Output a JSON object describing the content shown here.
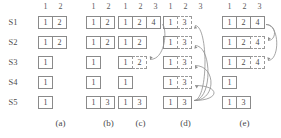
{
  "figure": {
    "row_labels": [
      "S1",
      "S2",
      "S3",
      "S4",
      "S5"
    ],
    "captions": [
      "(a)",
      "(b)",
      "(c)",
      "(d)",
      "(e)"
    ],
    "panels": [
      {
        "id": "a",
        "caption": "(a)",
        "headers": [
          "1",
          "2"
        ],
        "rows": [
          {
            "label": "S1",
            "cells": [
              {
                "value": "1",
                "style": "solid"
              },
              {
                "value": "2",
                "style": "solid"
              }
            ]
          },
          {
            "label": "S2",
            "cells": [
              {
                "value": "1",
                "style": "solid"
              },
              {
                "value": "2",
                "style": "solid"
              }
            ]
          },
          {
            "label": "S3",
            "cells": [
              {
                "value": "1",
                "style": "solid"
              }
            ]
          },
          {
            "label": "S4",
            "cells": [
              {
                "value": "1",
                "style": "solid"
              }
            ]
          },
          {
            "label": "S5",
            "cells": [
              {
                "value": "1",
                "style": "solid"
              }
            ]
          }
        ],
        "arrows": []
      },
      {
        "id": "b",
        "caption": "(b)",
        "headers": [
          "1",
          "2"
        ],
        "rows": [
          {
            "label": "S1",
            "cells": [
              {
                "value": "1",
                "style": "solid"
              },
              {
                "value": "2",
                "style": "solid"
              }
            ]
          },
          {
            "label": "S2",
            "cells": [
              {
                "value": "1",
                "style": "solid"
              },
              {
                "value": "2",
                "style": "solid"
              }
            ]
          },
          {
            "label": "S3",
            "cells": [
              {
                "value": "1",
                "style": "solid"
              }
            ]
          },
          {
            "label": "S4",
            "cells": [
              {
                "value": "1",
                "style": "solid"
              }
            ]
          },
          {
            "label": "S5",
            "cells": [
              {
                "value": "1",
                "style": "solid"
              },
              {
                "value": "3",
                "style": "solid"
              }
            ]
          }
        ],
        "arrows": []
      },
      {
        "id": "c",
        "caption": "(c)",
        "headers": [
          "1",
          "2",
          "3"
        ],
        "rows": [
          {
            "label": "S1",
            "cells": [
              {
                "value": "1",
                "style": "solid"
              },
              {
                "value": "2",
                "style": "solid"
              },
              {
                "value": "4",
                "style": "solid"
              }
            ]
          },
          {
            "label": "S2",
            "cells": [
              {
                "value": "1",
                "style": "solid"
              },
              {
                "value": "2",
                "style": "solid"
              }
            ]
          },
          {
            "label": "S3",
            "cells": [
              {
                "value": "1",
                "style": "solid"
              },
              {
                "value": "2",
                "style": "dashed"
              }
            ]
          },
          {
            "label": "S4",
            "cells": [
              {
                "value": "1",
                "style": "solid"
              }
            ]
          },
          {
            "label": "S5",
            "cells": [
              {
                "value": "1",
                "style": "solid"
              },
              {
                "value": "3",
                "style": "solid"
              }
            ]
          }
        ],
        "arrows": [
          {
            "from_row": "S1",
            "to_row": "S3"
          }
        ]
      },
      {
        "id": "d",
        "caption": "(d)",
        "headers": [
          "1",
          "2",
          "3"
        ],
        "rows": [
          {
            "label": "S1",
            "cells": [
              {
                "value": "1",
                "style": "solid"
              },
              {
                "value": "3",
                "style": "dashed"
              }
            ]
          },
          {
            "label": "S2",
            "cells": [
              {
                "value": "1",
                "style": "solid"
              },
              {
                "value": "3",
                "style": "dashed"
              }
            ]
          },
          {
            "label": "S3",
            "cells": [
              {
                "value": "1",
                "style": "solid"
              },
              {
                "value": "3",
                "style": "dashed"
              }
            ]
          },
          {
            "label": "S4",
            "cells": [
              {
                "value": "1",
                "style": "solid"
              },
              {
                "value": "3",
                "style": "dashed"
              }
            ]
          },
          {
            "label": "S5",
            "cells": [
              {
                "value": "1",
                "style": "solid"
              },
              {
                "value": "3",
                "style": "solid"
              }
            ]
          }
        ],
        "arrows": [
          {
            "from_row": "S5",
            "to_row": "S1"
          },
          {
            "from_row": "S5",
            "to_row": "S2"
          },
          {
            "from_row": "S5",
            "to_row": "S3"
          },
          {
            "from_row": "S5",
            "to_row": "S4"
          }
        ]
      },
      {
        "id": "e",
        "caption": "(e)",
        "headers": [
          "1",
          "2",
          "3"
        ],
        "rows": [
          {
            "label": "S1",
            "cells": [
              {
                "value": "1",
                "style": "solid"
              },
              {
                "value": "2",
                "style": "solid"
              },
              {
                "value": "4",
                "style": "solid"
              }
            ]
          },
          {
            "label": "S2",
            "cells": [
              {
                "value": "1",
                "style": "solid"
              },
              {
                "value": "2",
                "style": "solid"
              },
              {
                "value": "4",
                "style": "dashed"
              }
            ]
          },
          {
            "label": "S3",
            "cells": [
              {
                "value": "1",
                "style": "solid"
              },
              {
                "value": "2",
                "style": "solid"
              },
              {
                "value": "4",
                "style": "dashed"
              }
            ]
          },
          {
            "label": "S4",
            "cells": [
              {
                "value": "1",
                "style": "solid"
              }
            ]
          },
          {
            "label": "S5",
            "cells": [
              {
                "value": "1",
                "style": "solid"
              },
              {
                "value": "3",
                "style": "solid"
              }
            ]
          }
        ],
        "arrows": [
          {
            "from_row": "S1",
            "to_row": "S2"
          },
          {
            "from_row": "S1",
            "to_row": "S3"
          }
        ]
      }
    ],
    "layout": {
      "panel_left": [
        38,
        86,
        118,
        163,
        222
      ],
      "row_tops": [
        16,
        36,
        56,
        76,
        96
      ],
      "cell_width": 15,
      "cell_height": 13,
      "colors": {
        "border": "#8a8a8a",
        "dashed_border": "#9a9a9a",
        "text": "#4a4a4a",
        "arrow": "#8e8e8e"
      }
    }
  }
}
